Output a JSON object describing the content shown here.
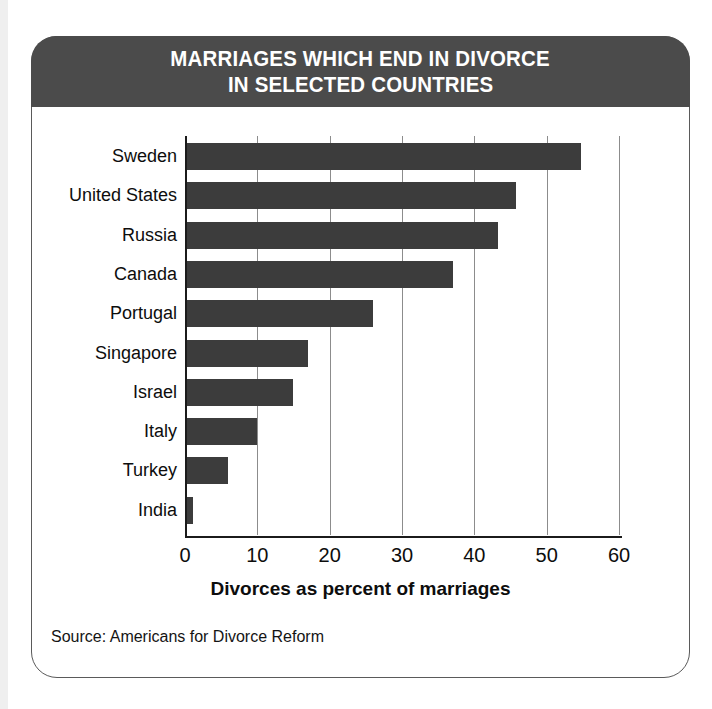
{
  "figure": {
    "title_line1": "MARRIAGES WHICH END IN DIVORCE",
    "title_line2": "IN SELECTED COUNTRIES",
    "source": "Source: Americans for Divorce Reform",
    "header_color": "#4b4b4b",
    "bar_color": "#3c3c3c",
    "frame_color": "#5a5a5a",
    "grid_color": "#8c8c8c"
  },
  "chart_data": {
    "type": "bar",
    "orientation": "horizontal",
    "title": "MARRIAGES WHICH END IN DIVORCE IN SELECTED COUNTRIES",
    "xlabel": "Divorces as percent of marriages",
    "ylabel": "",
    "categories": [
      "Sweden",
      "United States",
      "Russia",
      "Canada",
      "Portugal",
      "Singapore",
      "Israel",
      "Italy",
      "Turkey",
      "India"
    ],
    "values": [
      54.7,
      45.8,
      43.3,
      37.0,
      26.0,
      17.0,
      14.9,
      10.0,
      6.0,
      1.1
    ],
    "xlim": [
      0,
      60
    ],
    "xticks": [
      0,
      10,
      20,
      30,
      40,
      50,
      60
    ],
    "xtick_labels": [
      "0",
      "10",
      "20",
      "30",
      "40",
      "50",
      "60"
    ],
    "grid": "vertical",
    "legend": "none",
    "source": "Source: Americans for Divorce Reform"
  }
}
